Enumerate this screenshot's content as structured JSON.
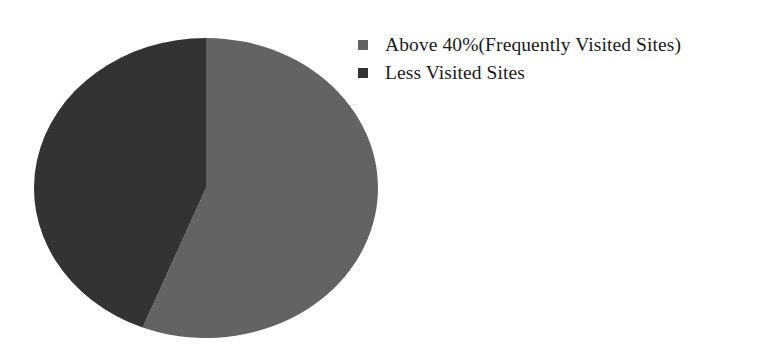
{
  "chart_data": {
    "type": "pie",
    "title": "",
    "subtitle": "",
    "xlabel": "",
    "ylabel": "",
    "grid": false,
    "legend_position": "right-top",
    "start_angle_deg": 0,
    "direction": "clockwise",
    "categories": [
      "Above 40%(Frequently Visited Sites)",
      "Less Visited Sites"
    ],
    "values": [
      56,
      44
    ],
    "value_unit": "percent",
    "slices": [
      {
        "label": "Above 40%(Frequently Visited Sites)",
        "value": 56,
        "angle_deg": 201.6,
        "color": "#636363"
      },
      {
        "label": "Less Visited Sites",
        "value": 44,
        "angle_deg": 158.4,
        "color": "#333333"
      }
    ],
    "annotations": []
  },
  "figure": {
    "background_color": "#ffffff",
    "pie": {
      "center_x": 206,
      "center_y": 188,
      "radius_x": 172,
      "radius_y": 150
    }
  },
  "legend": {
    "items": [
      {
        "label": "Above 40%(Frequently Visited Sites)",
        "color": "#636363",
        "swatch_name": "legend-swatch-frequently-visited"
      },
      {
        "label": "Less Visited Sites",
        "color": "#333333",
        "swatch_name": "legend-swatch-less-visited"
      }
    ]
  }
}
